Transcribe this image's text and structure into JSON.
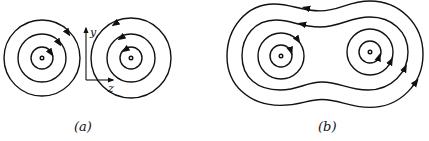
{
  "figure": {
    "panel_a": {
      "label": "(a)",
      "axis_y_label": "y",
      "axis_z_label": "z",
      "description": "Two separate sets of concentric circular field lines around two point sources, opposite circulation"
    },
    "panel_b": {
      "label": "(b)",
      "description": "Two sets of concentric field lines merging into peanut-shaped outer loops enclosing both sources, same circulation"
    },
    "colors": {
      "line": "#111111",
      "background": "#ffffff"
    }
  }
}
